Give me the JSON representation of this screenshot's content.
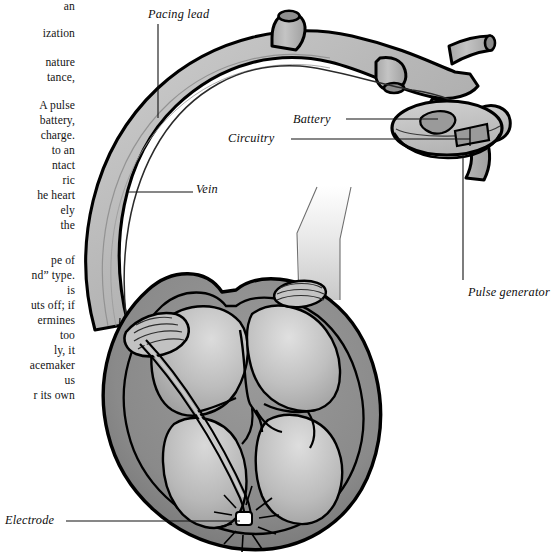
{
  "page": {
    "background": "#ffffff",
    "width": 557,
    "height": 556,
    "kind": "book-page-figure"
  },
  "body_text": {
    "note": "Left-hand column of running book text, clipped by the page gutter so only line endings are visible.",
    "lines": [
      "an",
      "ization",
      "nature",
      "tance,",
      "A pulse",
      "battery,",
      "charge.",
      "to an",
      "ntact",
      "ric",
      "he heart",
      "ely",
      "the",
      "pe of",
      "nd” type.",
      "is",
      "uts off; if",
      "ermines",
      "too",
      "ly, it",
      "acemaker",
      "us",
      "r its own"
    ]
  },
  "figure": {
    "labels": {
      "pacing_lead": "Pacing lead",
      "battery": "Battery",
      "circuitry": "Circuitry",
      "vein": "Vein",
      "pulse_generator": "Pulse generator",
      "electrode": "Electrode"
    },
    "parts": [
      {
        "name": "vein",
        "description": "large curved branching vein carrying the pacing lead"
      },
      {
        "name": "pacing-lead",
        "description": "thin wire threaded through the vein into the heart"
      },
      {
        "name": "pulse-generator",
        "description": "oval implanted device containing battery and circuitry"
      },
      {
        "name": "battery",
        "description": "oval component inside the pulse generator"
      },
      {
        "name": "circuitry",
        "description": "quadrilateral component inside the pulse generator"
      },
      {
        "name": "heart",
        "description": "cross-sectioned heart with four chambers and valves"
      },
      {
        "name": "aorta",
        "description": "pale vessel rising from the top of the heart"
      },
      {
        "name": "electrode",
        "description": "lead tip in the right ventricle emitting a spark"
      }
    ],
    "colors": {
      "outline": "#000000",
      "vessel_fill": "#b9b9b9",
      "vessel_shadow": "#9b9b9b",
      "heart_wall": "#8d8d8d",
      "chamber_fill": "#b6b6b6",
      "chamber_highlight": "#d8d8d8",
      "device_fill": "#c6c6c6",
      "device_part": "#9a9a9a",
      "aorta_fill": "#e6e6e6",
      "electrode_fill": "#ffffff",
      "leader_line": "#111111",
      "label_text": "#0d0d0d"
    }
  }
}
